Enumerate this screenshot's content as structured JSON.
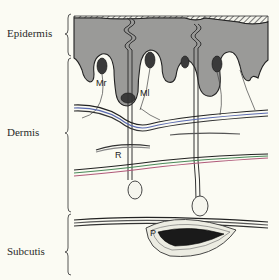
{
  "diagram": {
    "type": "anatomical cross-section of skin",
    "layers": [
      {
        "id": "epidermis",
        "label": "Epidermis"
      },
      {
        "id": "dermis",
        "label": "Dermis"
      },
      {
        "id": "subcutis",
        "label": "Subcutis"
      }
    ],
    "structures": [
      {
        "id": "mr",
        "label": "Mr"
      },
      {
        "id": "ml",
        "label": "Ml"
      },
      {
        "id": "r",
        "label": "R"
      },
      {
        "id": "p",
        "label": "P"
      }
    ],
    "colors": {
      "background": "#fbfbf3",
      "epidermis_fill": "#9a9a98",
      "line": "#333333",
      "fiber_accent_green": "#4a8a5a",
      "fiber_accent_pink": "#b05a7a",
      "fiber_accent_blue": "#5a6ab0"
    }
  }
}
